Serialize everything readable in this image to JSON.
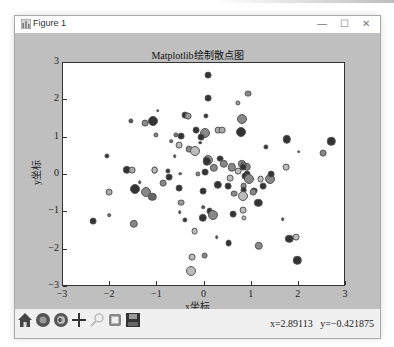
{
  "window": {
    "title": "Figure 1",
    "controls": {
      "minimize": "—",
      "maximize": "☐",
      "close": "✕"
    }
  },
  "toolbar": {
    "buttons": [
      {
        "name": "home",
        "icon": "home-icon"
      },
      {
        "name": "back",
        "icon": "back-arrow-icon"
      },
      {
        "name": "forward",
        "icon": "forward-arrow-icon"
      },
      {
        "name": "pan",
        "icon": "move-cross-icon"
      },
      {
        "name": "zoom",
        "icon": "zoom-rect-icon"
      },
      {
        "name": "configure-subplots",
        "icon": "subplots-icon"
      },
      {
        "name": "save",
        "icon": "floppy-disk-icon"
      }
    ],
    "cursor_coords": "x=2.89113   y=−0.421875"
  },
  "chart_data": {
    "type": "scatter",
    "title": "Matplotlib绘制散点图",
    "xlabel": "x坐标",
    "ylabel": "y坐标",
    "xlim": [
      -3,
      3
    ],
    "ylim": [
      -3,
      3
    ],
    "xticks": [
      "−3",
      "−2",
      "−1",
      "0",
      "1",
      "2",
      "3"
    ],
    "yticks": [
      "3",
      "2",
      "1",
      "0",
      "−1",
      "−2",
      "−3"
    ],
    "grid": false,
    "points": [
      {
        "x": 0.07,
        "y": 2.68,
        "s": 3,
        "c": "#333333"
      },
      {
        "x": 0.08,
        "y": 2.07,
        "s": 3,
        "c": "#333333"
      },
      {
        "x": -0.99,
        "y": 1.72,
        "s": 1,
        "c": "#555555"
      },
      {
        "x": -1.56,
        "y": 1.45,
        "s": 2,
        "c": "#555555"
      },
      {
        "x": -1.26,
        "y": 1.38,
        "s": 3,
        "c": "#888888"
      },
      {
        "x": -1.09,
        "y": 1.45,
        "s": 5,
        "c": "#333333"
      },
      {
        "x": -0.41,
        "y": 1.61,
        "s": 3,
        "c": "#333333"
      },
      {
        "x": -0.35,
        "y": 1.58,
        "s": 3,
        "c": "#999999"
      },
      {
        "x": 0.03,
        "y": 1.58,
        "s": 2,
        "c": "#333333"
      },
      {
        "x": 0.71,
        "y": 1.93,
        "s": 2,
        "c": "#999999"
      },
      {
        "x": 0.93,
        "y": 2.18,
        "s": 3,
        "c": "#888888"
      },
      {
        "x": 0.79,
        "y": 1.5,
        "s": 5,
        "c": "#888888"
      },
      {
        "x": 0.77,
        "y": 1.16,
        "s": 5,
        "c": "#333333"
      },
      {
        "x": -0.6,
        "y": 1.07,
        "s": 2,
        "c": "#777777"
      },
      {
        "x": -0.18,
        "y": 1.21,
        "s": 3,
        "c": "#333333"
      },
      {
        "x": 0.01,
        "y": 1.13,
        "s": 5,
        "c": "#888888"
      },
      {
        "x": 0.29,
        "y": 1.21,
        "s": 3,
        "c": "#aaaaaa"
      },
      {
        "x": 0.37,
        "y": 1.21,
        "s": 3,
        "c": "#aaaaaa"
      },
      {
        "x": -0.08,
        "y": 1.02,
        "s": 3,
        "c": "#333333"
      },
      {
        "x": -0.71,
        "y": 0.91,
        "s": 1,
        "c": "#777777"
      },
      {
        "x": 1.75,
        "y": 0.96,
        "s": 4,
        "c": "#333333"
      },
      {
        "x": 1.3,
        "y": 0.75,
        "s": 2,
        "c": "#333333"
      },
      {
        "x": 2.0,
        "y": 0.62,
        "s": 1,
        "c": "#555555"
      },
      {
        "x": 2.69,
        "y": 0.9,
        "s": 4,
        "c": "#333333"
      },
      {
        "x": 2.52,
        "y": 0.59,
        "s": 3,
        "c": "#888888"
      },
      {
        "x": -2.07,
        "y": 0.51,
        "s": 2,
        "c": "#333333"
      },
      {
        "x": -1.65,
        "y": 0.14,
        "s": 4,
        "c": "#333333"
      },
      {
        "x": -1.54,
        "y": 0.13,
        "s": 3,
        "c": "#aaaaaa"
      },
      {
        "x": -1.06,
        "y": 0.13,
        "s": 3,
        "c": "#bbbbbb"
      },
      {
        "x": -1.37,
        "y": -0.19,
        "s": 1,
        "c": "#555555"
      },
      {
        "x": -2.03,
        "y": -0.46,
        "s": 3,
        "c": "#aaaaaa"
      },
      {
        "x": -1.47,
        "y": -0.38,
        "s": 5,
        "c": "#333333"
      },
      {
        "x": -1.25,
        "y": -0.46,
        "s": 5,
        "c": "#888888"
      },
      {
        "x": -1.11,
        "y": -0.59,
        "s": 4,
        "c": "#666666"
      },
      {
        "x": -1.03,
        "y": 1.07,
        "s": 2,
        "c": "#888888"
      },
      {
        "x": -0.5,
        "y": 1.04,
        "s": 3,
        "c": "#333333"
      },
      {
        "x": -0.54,
        "y": 0.81,
        "s": 3,
        "c": "#bbbbbb"
      },
      {
        "x": -0.09,
        "y": 0.86,
        "s": 1,
        "c": "#333333"
      },
      {
        "x": -0.32,
        "y": 0.7,
        "s": 3,
        "c": "#888888"
      },
      {
        "x": -0.63,
        "y": 0.51,
        "s": 1,
        "c": "#555555"
      },
      {
        "x": -0.2,
        "y": 0.64,
        "s": 5,
        "c": "#bbbbbb"
      },
      {
        "x": 0.07,
        "y": 0.41,
        "s": 5,
        "c": "#999999"
      },
      {
        "x": 0.33,
        "y": 0.44,
        "s": 3,
        "c": "#333333"
      },
      {
        "x": 0.05,
        "y": 0.37,
        "s": 4,
        "c": "#333333"
      },
      {
        "x": 0.41,
        "y": 0.3,
        "s": 4,
        "c": "#888888"
      },
      {
        "x": 0.58,
        "y": 0.21,
        "s": 4,
        "c": "#888888"
      },
      {
        "x": 0.2,
        "y": 0.19,
        "s": 4,
        "c": "#888888"
      },
      {
        "x": 0.9,
        "y": 0.22,
        "s": 4,
        "c": "#888888"
      },
      {
        "x": 0.79,
        "y": 0.3,
        "s": 4,
        "c": "#888888"
      },
      {
        "x": 0.83,
        "y": 0.27,
        "s": 3,
        "c": "#777777"
      },
      {
        "x": 0.82,
        "y": 0.21,
        "s": 3,
        "c": "#333333"
      },
      {
        "x": -1.06,
        "y": 0.14,
        "s": 3,
        "c": "#bbbbbb"
      },
      {
        "x": -0.77,
        "y": 0.11,
        "s": 2,
        "c": "#333333"
      },
      {
        "x": -0.75,
        "y": -0.05,
        "s": 3,
        "c": "#333333"
      },
      {
        "x": -0.52,
        "y": 0.04,
        "s": 1,
        "c": "#777777"
      },
      {
        "x": -0.14,
        "y": 0.03,
        "s": 2,
        "c": "#888888"
      },
      {
        "x": 0.01,
        "y": 0.08,
        "s": 3,
        "c": "#333333"
      },
      {
        "x": 0.71,
        "y": 0.11,
        "s": 3,
        "c": "#bbbbbb"
      },
      {
        "x": 0.9,
        "y": 0.03,
        "s": 3,
        "c": "#333333"
      },
      {
        "x": 0.54,
        "y": -0.08,
        "s": 3,
        "c": "#bbbbbb"
      },
      {
        "x": 1.73,
        "y": 0.22,
        "s": 3,
        "c": "#bbbbbb"
      },
      {
        "x": 0.85,
        "y": -0.03,
        "s": 3,
        "c": "#333333"
      },
      {
        "x": 0.95,
        "y": -0.12,
        "s": 5,
        "c": "#888888"
      },
      {
        "x": 1.19,
        "y": -0.12,
        "s": 3,
        "c": "#bbbbbb"
      },
      {
        "x": 1.38,
        "y": -0.12,
        "s": 5,
        "c": "#888888"
      },
      {
        "x": 1.41,
        "y": 0.03,
        "s": 3,
        "c": "#333333"
      },
      {
        "x": -0.87,
        "y": -0.22,
        "s": 3,
        "c": "#888888"
      },
      {
        "x": 0.28,
        "y": -0.27,
        "s": 4,
        "c": "#333333"
      },
      {
        "x": 0.5,
        "y": -0.29,
        "s": 3,
        "c": "#333333"
      },
      {
        "x": 0.83,
        "y": -0.29,
        "s": 3,
        "c": "#888888"
      },
      {
        "x": 1.24,
        "y": -0.29,
        "s": 3,
        "c": "#333333"
      },
      {
        "x": 1.05,
        "y": -0.42,
        "s": 3,
        "c": "#333333"
      },
      {
        "x": 1.03,
        "y": -0.46,
        "s": 3,
        "c": "#888888"
      },
      {
        "x": 0.83,
        "y": -0.4,
        "s": 3,
        "c": "#333333"
      },
      {
        "x": 0.82,
        "y": -0.56,
        "s": 5,
        "c": "#bbbbbb"
      },
      {
        "x": -0.54,
        "y": -0.36,
        "s": 3,
        "c": "#333333"
      },
      {
        "x": -0.03,
        "y": -0.44,
        "s": 3,
        "c": "#333333"
      },
      {
        "x": 0.62,
        "y": -0.5,
        "s": 3,
        "c": "#888888"
      },
      {
        "x": 1.14,
        "y": -0.75,
        "s": 4,
        "c": "#333333"
      },
      {
        "x": -0.5,
        "y": -0.74,
        "s": 3,
        "c": "#999999"
      },
      {
        "x": -0.03,
        "y": -0.86,
        "s": 1,
        "c": "#555555"
      },
      {
        "x": -0.53,
        "y": -1.0,
        "s": 1,
        "c": "#555555"
      },
      {
        "x": 0.11,
        "y": -0.96,
        "s": 3,
        "c": "#333333"
      },
      {
        "x": 0.19,
        "y": -1.06,
        "s": 5,
        "c": "#888888"
      },
      {
        "x": -0.04,
        "y": -1.15,
        "s": 4,
        "c": "#333333"
      },
      {
        "x": 0.6,
        "y": -1.04,
        "s": 3,
        "c": "#333333"
      },
      {
        "x": 0.82,
        "y": -0.94,
        "s": 3,
        "c": "#bbbbbb"
      },
      {
        "x": 0.83,
        "y": -1.15,
        "s": 2,
        "c": "#bbbbbb"
      },
      {
        "x": -0.42,
        "y": -1.2,
        "s": 2,
        "c": "#333333"
      },
      {
        "x": -0.21,
        "y": -1.51,
        "s": 3,
        "c": "#bbbbbb"
      },
      {
        "x": 0.26,
        "y": -1.66,
        "s": 1,
        "c": "#555555"
      },
      {
        "x": 0.51,
        "y": -1.82,
        "s": 3,
        "c": "#333333"
      },
      {
        "x": -2.36,
        "y": -1.24,
        "s": 3,
        "c": "#333333"
      },
      {
        "x": -2.02,
        "y": -1.07,
        "s": 1,
        "c": "#777777"
      },
      {
        "x": -1.5,
        "y": -1.31,
        "s": 4,
        "c": "#888888"
      },
      {
        "x": 1.15,
        "y": -1.9,
        "s": 4,
        "c": "#888888"
      },
      {
        "x": 1.8,
        "y": -1.71,
        "s": 4,
        "c": "#333333"
      },
      {
        "x": 1.95,
        "y": -1.66,
        "s": 3,
        "c": "#bbbbbb"
      },
      {
        "x": 1.97,
        "y": -2.28,
        "s": 4,
        "c": "#333333"
      },
      {
        "x": 1.66,
        "y": -1.19,
        "s": 1,
        "c": "#555555"
      },
      {
        "x": -0.26,
        "y": -2.19,
        "s": 3,
        "c": "#bbbbbb"
      },
      {
        "x": 0.0,
        "y": -2.16,
        "s": 3,
        "c": "#888888"
      },
      {
        "x": -0.29,
        "y": -2.56,
        "s": 5,
        "c": "#bbbbbb"
      }
    ]
  }
}
